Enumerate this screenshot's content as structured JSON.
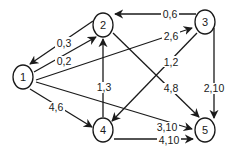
{
  "graph": {
    "nodes": [
      {
        "id": "1",
        "label": "1",
        "x": 23,
        "y": 77
      },
      {
        "id": "2",
        "label": "2",
        "x": 103,
        "y": 25
      },
      {
        "id": "3",
        "label": "3",
        "x": 205,
        "y": 22
      },
      {
        "id": "4",
        "label": "4",
        "x": 103,
        "y": 130
      },
      {
        "id": "5",
        "label": "5",
        "x": 205,
        "y": 130
      }
    ],
    "edges": [
      {
        "from": "2",
        "to": "1",
        "label": "0,3"
      },
      {
        "from": "1",
        "to": "2",
        "label": "0,2"
      },
      {
        "from": "3",
        "to": "2",
        "label": "0,6"
      },
      {
        "from": "1",
        "to": "3",
        "label": "2,6"
      },
      {
        "from": "3",
        "to": "4",
        "label": "1,2"
      },
      {
        "from": "2",
        "to": "5",
        "label": "4,8"
      },
      {
        "from": "3",
        "to": "5",
        "label": "2,10"
      },
      {
        "from": "4",
        "to": "2",
        "label": "1,3"
      },
      {
        "from": "1",
        "to": "4",
        "label": "4,6"
      },
      {
        "from": "1",
        "to": "5",
        "label": "3,10"
      },
      {
        "from": "4",
        "to": "5",
        "label": "4,10"
      }
    ]
  }
}
